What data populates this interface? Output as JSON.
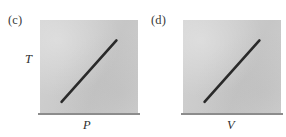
{
  "figure": {
    "background_color": "#ffffff",
    "panels": [
      {
        "letter": "(c)",
        "y_axis_label": "T",
        "x_axis_label": "P",
        "plot_fill_color": "#cccccc",
        "axis_line_color": "#8c8c8c",
        "trend_line_color": "#2a2a2a"
      },
      {
        "letter": "(d)",
        "y_axis_label": "n",
        "x_axis_label": "V",
        "plot_fill_color": "#cccccc",
        "axis_line_color": "#8c8c8c",
        "trend_line_color": "#2a2a2a"
      }
    ]
  },
  "chart_data": [
    {
      "type": "line",
      "title": "(c)",
      "xlabel": "P",
      "ylabel": "T",
      "x": [
        0.22,
        0.78
      ],
      "y": [
        0.12,
        0.78
      ],
      "xlim": [
        0,
        1
      ],
      "ylim": [
        0,
        1
      ],
      "grid": false,
      "legend": false,
      "tick_labels": {
        "x": [],
        "y": []
      },
      "annotations": [],
      "relationship": "linear increasing",
      "series": [
        {
          "name": "T vs P",
          "x": [
            0.22,
            0.78
          ],
          "values": [
            0.12,
            0.78
          ]
        }
      ]
    },
    {
      "type": "line",
      "title": "(d)",
      "xlabel": "V",
      "ylabel": "n",
      "x": [
        0.22,
        0.78
      ],
      "y": [
        0.12,
        0.78
      ],
      "xlim": [
        0,
        1
      ],
      "ylim": [
        0,
        1
      ],
      "grid": false,
      "legend": false,
      "tick_labels": {
        "x": [],
        "y": []
      },
      "annotations": [],
      "relationship": "linear increasing",
      "series": [
        {
          "name": "n vs V",
          "x": [
            0.22,
            0.78
          ],
          "values": [
            0.12,
            0.78
          ]
        }
      ]
    }
  ]
}
